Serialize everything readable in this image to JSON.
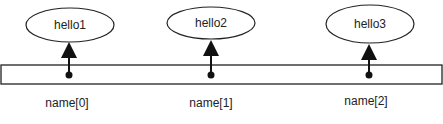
{
  "diagram": {
    "strings": [
      {
        "value": "hello1",
        "index_label": "name[0]"
      },
      {
        "value": "hello2",
        "index_label": "name[1]"
      },
      {
        "value": "hello3",
        "index_label": "name[2]"
      }
    ]
  }
}
